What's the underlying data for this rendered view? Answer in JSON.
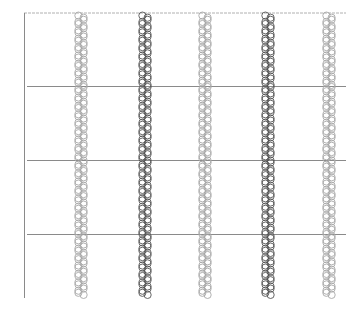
{
  "chart_data": {
    "type": "scatter",
    "title": "",
    "xlabel": "",
    "ylabel": "",
    "legend": [],
    "grid": true,
    "series": [
      {
        "name": "strip-1",
        "x_px": 81,
        "color": "#a8a8a8",
        "y_range_px": [
          12,
          298
        ]
      },
      {
        "name": "strip-2",
        "x_px": 145,
        "color": "#555555",
        "y_range_px": [
          12,
          298
        ]
      },
      {
        "name": "strip-3",
        "x_px": 205,
        "color": "#a8a8a8",
        "y_range_px": [
          12,
          298
        ]
      },
      {
        "name": "strip-4",
        "x_px": 268,
        "color": "#555555",
        "y_range_px": [
          12,
          298
        ]
      },
      {
        "name": "strip-5",
        "x_px": 329,
        "color": "#a8a8a8",
        "y_range_px": [
          12,
          298
        ]
      }
    ],
    "gridlines_y_px": [
      86,
      160,
      234
    ],
    "plot_area_px": {
      "left": 24,
      "top": 13,
      "right": 346,
      "bottom": 298
    }
  },
  "colors": {
    "axis": "#8a8a8a",
    "gridline": "#8a8a8a",
    "top_border": "#b0b0b0",
    "light_marker": "#a8a8a8",
    "dark_marker": "#555555"
  }
}
